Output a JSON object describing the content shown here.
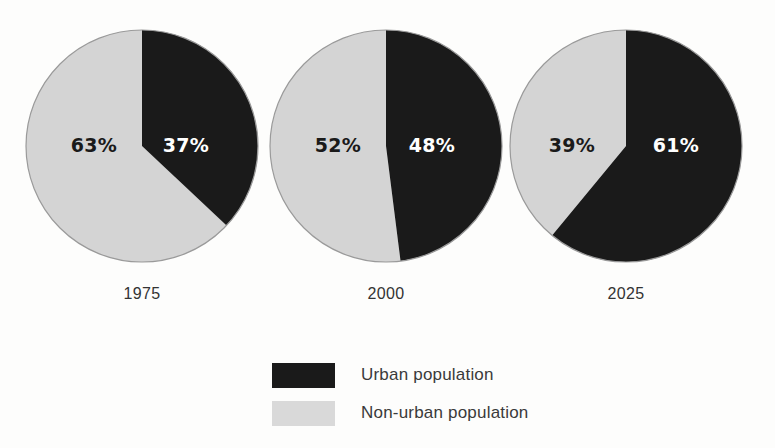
{
  "chart_data": {
    "type": "pie",
    "title": "",
    "subtitle": "",
    "xlabel": "",
    "ylabel": "",
    "grid": false,
    "legend_position": "bottom-center",
    "categories": [
      "Urban population",
      "Non-urban population"
    ],
    "colors": {
      "urban": "#1a1a1a",
      "nonurban": "#d4d4d4",
      "outline": "#9a9a9a",
      "background": "#fdfdfc",
      "label_on_dark": "#ffffff",
      "label_on_light": "#1a1a1a",
      "text": "#3a3a3a"
    },
    "panels": [
      {
        "year": "1975",
        "slices": [
          {
            "name": "Urban population",
            "value": 37,
            "label": "37%"
          },
          {
            "name": "Non-urban population",
            "value": 63,
            "label": "63%"
          }
        ]
      },
      {
        "year": "2000",
        "slices": [
          {
            "name": "Urban population",
            "value": 48,
            "label": "48%"
          },
          {
            "name": "Non-urban population",
            "value": 52,
            "label": "52%"
          }
        ]
      },
      {
        "year": "2025",
        "slices": [
          {
            "name": "Urban population",
            "value": 61,
            "label": "61%"
          },
          {
            "name": "Non-urban population",
            "value": 39,
            "label": "39%"
          }
        ]
      }
    ]
  },
  "panels": [
    {
      "year": "1975",
      "urban_label": "37%",
      "nonurban_label": "63%"
    },
    {
      "year": "2000",
      "urban_label": "48%",
      "nonurban_label": "52%"
    },
    {
      "year": "2025",
      "urban_label": "61%",
      "nonurban_label": "39%"
    }
  ],
  "legend": {
    "items": [
      {
        "label": "Urban population",
        "swatch": "urban-swatch"
      },
      {
        "label": "Non-urban population",
        "swatch": "non-urban-swatch"
      }
    ]
  }
}
